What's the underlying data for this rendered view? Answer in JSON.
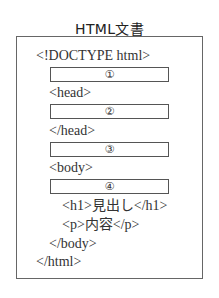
{
  "title": "HTML文書",
  "lines": {
    "doctype": "<!DOCTYPE html>",
    "head_open": "<head>",
    "head_close": "</head>",
    "body_open": "<body>",
    "h1": "<h1>見出し</h1>",
    "p": "<p>内容</p>",
    "body_close": "</body>",
    "html_close": "</html>"
  },
  "slots": [
    "①",
    "②",
    "③",
    "④"
  ]
}
